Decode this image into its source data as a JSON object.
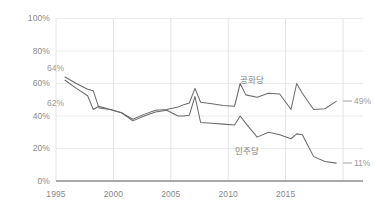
{
  "chart_data": {
    "type": "line",
    "title": "",
    "xlabel": "",
    "ylabel": "",
    "xlim": [
      1994.2,
      2019.6
    ],
    "ylim": [
      0,
      100
    ],
    "grid": true,
    "legend_position": "inline-annotations",
    "y_ticks": [
      "0%",
      "20%",
      "40%",
      "60%",
      "80%",
      "100%"
    ],
    "y_tick_values": [
      0,
      20,
      40,
      60,
      80,
      100
    ],
    "x_ticks": [
      "1995",
      "2000",
      "2005",
      "2010",
      "2015"
    ],
    "x_tick_values": [
      1995,
      2000,
      2005,
      2010,
      2015
    ],
    "series": [
      {
        "name": "공화당",
        "color": "#6b6b6b",
        "start_label": "64%",
        "end_label": "49%",
        "x": [
          1995,
          1996,
          1997,
          1997.5,
          1998,
          1999,
          2000,
          2001,
          2002,
          2003,
          2004,
          2005,
          2005.5,
          2006,
          2006.5,
          2007,
          2008,
          2009,
          2010,
          2010.5,
          2011,
          2012,
          2013,
          2014,
          2015,
          2015.5,
          2016,
          2017,
          2018,
          2019
        ],
        "y": [
          64,
          60,
          56.5,
          55.5,
          45,
          44,
          42,
          38,
          41,
          43.5,
          44,
          45.5,
          47,
          48,
          57,
          48.5,
          47.5,
          46.5,
          46,
          60,
          53,
          51.5,
          54,
          53.5,
          44,
          60,
          54,
          44,
          44.5,
          49
        ]
      },
      {
        "name": "민주당",
        "color": "#6b6b6b",
        "start_label": "62%",
        "end_label": "11%",
        "x": [
          1995,
          1996,
          1997,
          1997.5,
          1998,
          1999,
          2000,
          2001,
          2002,
          2003,
          2004,
          2005,
          2005.5,
          2006,
          2006.5,
          2007,
          2008,
          2009,
          2010,
          2010.5,
          2011,
          2012,
          2013,
          2014,
          2015,
          2015.5,
          2016,
          2017,
          2018,
          2019
        ],
        "y": [
          62,
          57,
          52.5,
          44,
          46,
          44,
          42,
          37,
          40,
          42.5,
          43.5,
          40,
          40,
          40.5,
          52,
          36,
          35.5,
          35,
          34.5,
          40,
          35.5,
          27,
          30,
          28.5,
          26,
          29,
          28.5,
          15,
          12,
          11
        ]
      }
    ],
    "annotations": [
      {
        "text": "64%",
        "series": "공화당",
        "kind": "start-value"
      },
      {
        "text": "62%",
        "series": "민주당",
        "kind": "start-value"
      },
      {
        "text": "49%",
        "series": "공화당",
        "kind": "end-value"
      },
      {
        "text": "11%",
        "series": "민주당",
        "kind": "end-value"
      },
      {
        "text": "공화당",
        "series": "공화당",
        "kind": "series-label"
      },
      {
        "text": "민주당",
        "series": "민주당",
        "kind": "series-label"
      }
    ],
    "colors": {
      "line": "#6b6b6b",
      "grid": "#e6e6e6",
      "axis": "#8c8c8c",
      "tick_text": "#8a8a8a",
      "annotation_text": "#9a9a9a",
      "background": "#ffffff"
    }
  },
  "labels": {
    "y0": "0%",
    "y20": "20%",
    "y40": "40%",
    "y60": "60%",
    "y80": "80%",
    "y100": "100%",
    "x1995": "1995",
    "x2000": "2000",
    "x2005": "2005",
    "x2010": "2010",
    "x2015": "2015",
    "start_upper": "64%",
    "start_lower": "62%",
    "end_upper": "49%",
    "end_lower": "11%",
    "series_upper": "공화당",
    "series_lower": "민주당"
  }
}
